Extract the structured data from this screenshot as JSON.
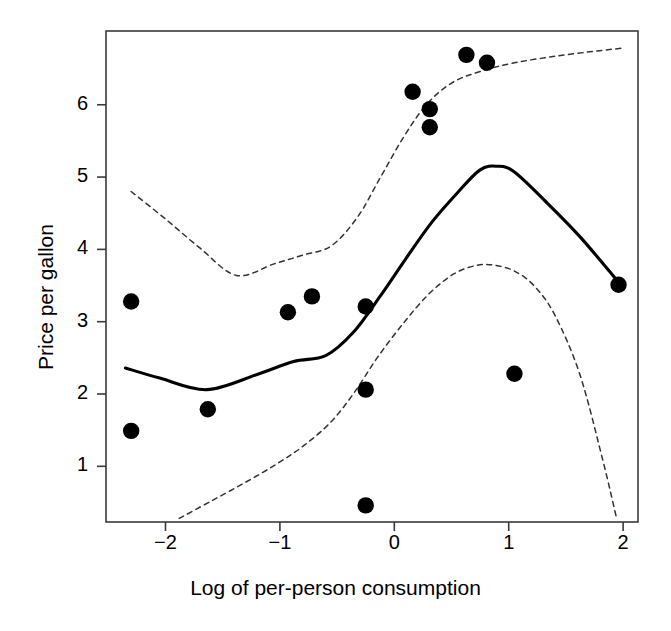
{
  "chart_data": {
    "type": "scatter",
    "title": "",
    "xlabel": "Log of per-person consumption",
    "ylabel": "Price per gallon",
    "xlim": [
      -2.52,
      2.13
    ],
    "ylim": [
      0.23,
      7.02
    ],
    "xticks": [
      -2,
      -1,
      0,
      1,
      2
    ],
    "xticklabels": [
      "−2",
      "−1",
      "0",
      "1",
      "2"
    ],
    "yticks": [
      1,
      2,
      3,
      4,
      5,
      6
    ],
    "yticklabels": [
      "1",
      "2",
      "3",
      "4",
      "5",
      "6"
    ],
    "grid": false,
    "legend": "none",
    "frame": "box",
    "points": [
      {
        "x": -2.3,
        "y": 3.28
      },
      {
        "x": -2.3,
        "y": 1.49
      },
      {
        "x": -1.63,
        "y": 1.79
      },
      {
        "x": -0.93,
        "y": 3.13
      },
      {
        "x": -0.72,
        "y": 3.35
      },
      {
        "x": -0.25,
        "y": 3.21
      },
      {
        "x": -0.25,
        "y": 2.06
      },
      {
        "x": -0.25,
        "y": 0.46
      },
      {
        "x": 0.16,
        "y": 6.18
      },
      {
        "x": 0.31,
        "y": 5.94
      },
      {
        "x": 0.31,
        "y": 5.69
      },
      {
        "x": 0.63,
        "y": 6.69
      },
      {
        "x": 0.81,
        "y": 6.58
      },
      {
        "x": 1.05,
        "y": 2.28
      },
      {
        "x": 1.96,
        "y": 3.51
      }
    ],
    "series": [
      {
        "name": "fit",
        "style": "solid",
        "x": [
          -2.35,
          -2.05,
          -1.64,
          -1.2,
          -0.88,
          -0.6,
          -0.36,
          -0.12,
          0.1,
          0.33,
          0.55,
          0.75,
          0.9,
          1.05,
          1.35,
          1.62,
          1.9,
          2.0
        ],
        "y": [
          2.36,
          2.22,
          2.06,
          2.27,
          2.45,
          2.53,
          2.85,
          3.36,
          3.87,
          4.38,
          4.78,
          5.1,
          5.15,
          5.07,
          4.62,
          4.18,
          3.66,
          3.47
        ]
      },
      {
        "name": "upper-band",
        "style": "dashed",
        "x": [
          -2.3,
          -2.0,
          -1.7,
          -1.38,
          -1.05,
          -0.8,
          -0.55,
          -0.32,
          -0.12,
          0.08,
          0.28,
          0.5,
          0.75,
          1.05,
          1.4,
          1.75,
          1.98
        ],
        "y": [
          4.8,
          4.42,
          4.02,
          3.64,
          3.8,
          3.92,
          4.05,
          4.45,
          5.0,
          5.55,
          6.0,
          6.3,
          6.46,
          6.58,
          6.67,
          6.74,
          6.78
        ]
      },
      {
        "name": "lower-band",
        "style": "dashed",
        "x": [
          -1.88,
          -1.6,
          -1.3,
          -1.02,
          -0.78,
          -0.55,
          -0.35,
          -0.15,
          0.08,
          0.3,
          0.52,
          0.72,
          0.88,
          1.05,
          1.22,
          1.4,
          1.62,
          1.82,
          1.94
        ],
        "y": [
          0.28,
          0.52,
          0.78,
          1.04,
          1.3,
          1.62,
          2.02,
          2.5,
          2.98,
          3.38,
          3.66,
          3.78,
          3.78,
          3.7,
          3.5,
          3.1,
          2.28,
          1.1,
          0.3
        ]
      }
    ]
  },
  "style": {
    "point_color": "#000000",
    "line_color": "#000000",
    "band_color": "#333333",
    "frame_color": "#3a3a3a",
    "background": "#ffffff"
  }
}
